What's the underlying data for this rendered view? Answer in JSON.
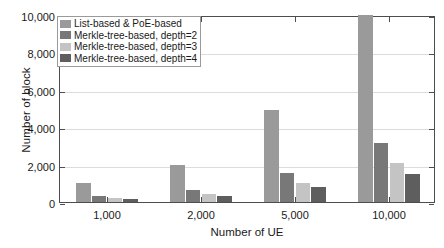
{
  "chart_data": {
    "type": "bar",
    "title": "",
    "xlabel": "Number of UE",
    "ylabel": "Number of block",
    "categories": [
      "1,000",
      "2,000",
      "5,000",
      "10,000"
    ],
    "x_values": [
      1000,
      2000,
      5000,
      10000
    ],
    "ylim": [
      0,
      10000
    ],
    "ytick_labels": [
      "0",
      "2,000",
      "4,000",
      "6,000",
      "8,000",
      "10,000"
    ],
    "ytick_values": [
      0,
      2000,
      4000,
      6000,
      8000,
      10000
    ],
    "grid": true,
    "legend_position": "upper left",
    "series": [
      {
        "name": "List-based & PoE-based",
        "color": "#9a9a9a",
        "values": [
          1000,
          2000,
          4900,
          10000
        ],
        "clipped": [
          false,
          false,
          false,
          true
        ]
      },
      {
        "name": "Merkle-tree-based, depth=2",
        "color": "#787878",
        "values": [
          330,
          640,
          1550,
          3150
        ],
        "clipped": [
          false,
          false,
          false,
          false
        ]
      },
      {
        "name": "Merkle-tree-based, depth=3",
        "color": "#c4c4c4",
        "values": [
          200,
          430,
          1030,
          2080
        ],
        "clipped": [
          false,
          false,
          false,
          false
        ]
      },
      {
        "name": "Merkle-tree-based, depth=4",
        "color": "#5e5e5e",
        "values": [
          140,
          320,
          780,
          1500
        ],
        "clipped": [
          false,
          false,
          false,
          false
        ]
      }
    ]
  },
  "axes": {
    "frame_color": "#4d4d4d",
    "grid_color": "#dcdcdc"
  }
}
